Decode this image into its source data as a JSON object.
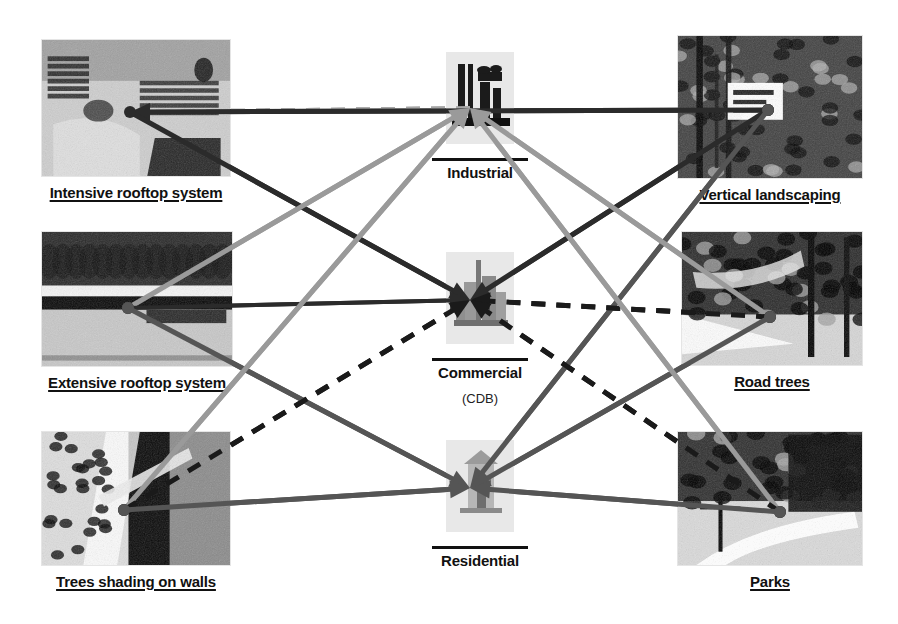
{
  "diagram": {
    "type": "network-diagram",
    "background": "#ffffff"
  },
  "colors": {
    "dark_line": "#2b2b2b",
    "mid_line": "#555555",
    "gray_line": "#9a9a9a",
    "dashed_black": "#1a1a1a",
    "dashed_gray": "#a6a6a6",
    "text": "#111111"
  },
  "left_nodes": [
    {
      "id": "intensive-rooftop",
      "label": "Intensive rooftop system",
      "photo": "rooftop-garden-photo",
      "x": 42,
      "y": 40,
      "w": 188,
      "h": 136,
      "anchor_x": 130,
      "anchor_y": 112
    },
    {
      "id": "extensive-rooftop",
      "label": "Extensive rooftop system",
      "photo": "green-roof-photo",
      "x": 42,
      "y": 232,
      "w": 190,
      "h": 134,
      "anchor_x": 128,
      "anchor_y": 308
    },
    {
      "id": "trees-shading-walls",
      "label": "Trees shading on walls",
      "photo": "tree-shade-wall-photo",
      "x": 42,
      "y": 432,
      "w": 188,
      "h": 133,
      "anchor_x": 124,
      "anchor_y": 510
    }
  ],
  "right_nodes": [
    {
      "id": "vertical-landscaping",
      "label": "Vertical landscaping",
      "photo": "vertical-garden-photo",
      "x": 678,
      "y": 36,
      "w": 184,
      "h": 142,
      "anchor_x": 768,
      "anchor_y": 110
    },
    {
      "id": "road-trees",
      "label": "Road trees",
      "photo": "street-trees-photo",
      "x": 682,
      "y": 232,
      "w": 180,
      "h": 133,
      "anchor_x": 770,
      "anchor_y": 317
    },
    {
      "id": "parks",
      "label": "Parks",
      "photo": "park-path-photo",
      "x": 678,
      "y": 432,
      "w": 184,
      "h": 133,
      "anchor_x": 780,
      "anchor_y": 512
    }
  ],
  "center_nodes": [
    {
      "id": "industrial",
      "label": "Industrial",
      "sublabel": "",
      "icon": "factory-icon",
      "x": 420,
      "y": 48,
      "anchor_x": 470,
      "anchor_y": 108
    },
    {
      "id": "commercial",
      "label": "Commercial",
      "sublabel": "(CDB)",
      "icon": "city-skyline-icon",
      "x": 420,
      "y": 248,
      "anchor_x": 470,
      "anchor_y": 300
    },
    {
      "id": "residential",
      "label": "Residential",
      "sublabel": "",
      "icon": "house-icon",
      "x": 420,
      "y": 436,
      "anchor_x": 470,
      "anchor_y": 488
    }
  ],
  "links": [
    {
      "id": "l1",
      "from": "industrial",
      "to": "intensive-rooftop",
      "style": "dashed",
      "color": "#a6a6a6",
      "width": 4,
      "arrow": false,
      "note": "horizontal dashed gray"
    },
    {
      "id": "l2",
      "from": "vertical-landscaping",
      "to": "intensive-rooftop",
      "style": "solid",
      "color": "#2b2b2b",
      "width": 5,
      "arrow": true
    },
    {
      "id": "l3",
      "from": "intensive-rooftop",
      "to": "commercial",
      "style": "solid",
      "color": "#2b2b2b",
      "width": 5,
      "arrow": true
    },
    {
      "id": "l4",
      "from": "extensive-rooftop",
      "to": "industrial",
      "style": "solid",
      "color": "#9a9a9a",
      "width": 5,
      "arrow": true
    },
    {
      "id": "l5",
      "from": "extensive-rooftop",
      "to": "commercial",
      "style": "solid",
      "color": "#2b2b2b",
      "width": 4,
      "arrow": true
    },
    {
      "id": "l6",
      "from": "extensive-rooftop",
      "to": "residential",
      "style": "solid",
      "color": "#555555",
      "width": 5,
      "arrow": true
    },
    {
      "id": "l7",
      "from": "trees-shading-walls",
      "to": "industrial",
      "style": "solid",
      "color": "#9a9a9a",
      "width": 5,
      "arrow": true
    },
    {
      "id": "l8",
      "from": "trees-shading-walls",
      "to": "commercial",
      "style": "dashed",
      "color": "#1a1a1a",
      "width": 5,
      "arrow": true
    },
    {
      "id": "l9",
      "from": "trees-shading-walls",
      "to": "residential",
      "style": "solid",
      "color": "#555555",
      "width": 5,
      "arrow": true
    },
    {
      "id": "l10",
      "from": "vertical-landscaping",
      "to": "commercial",
      "style": "solid",
      "color": "#2b2b2b",
      "width": 5,
      "arrow": true
    },
    {
      "id": "l11",
      "from": "vertical-landscaping",
      "to": "residential",
      "style": "solid",
      "color": "#555555",
      "width": 5,
      "arrow": true
    },
    {
      "id": "l12",
      "from": "road-trees",
      "to": "industrial",
      "style": "solid",
      "color": "#9a9a9a",
      "width": 5,
      "arrow": true
    },
    {
      "id": "l13",
      "from": "road-trees",
      "to": "commercial",
      "style": "dashed",
      "color": "#1a1a1a",
      "width": 5,
      "arrow": true
    },
    {
      "id": "l14",
      "from": "road-trees",
      "to": "residential",
      "style": "solid",
      "color": "#555555",
      "width": 5,
      "arrow": true
    },
    {
      "id": "l15",
      "from": "parks",
      "to": "industrial",
      "style": "solid",
      "color": "#9a9a9a",
      "width": 5,
      "arrow": true
    },
    {
      "id": "l16",
      "from": "parks",
      "to": "commercial",
      "style": "dashed",
      "color": "#1a1a1a",
      "width": 5,
      "arrow": true
    },
    {
      "id": "l17",
      "from": "parks",
      "to": "residential",
      "style": "solid",
      "color": "#555555",
      "width": 5,
      "arrow": true
    }
  ]
}
